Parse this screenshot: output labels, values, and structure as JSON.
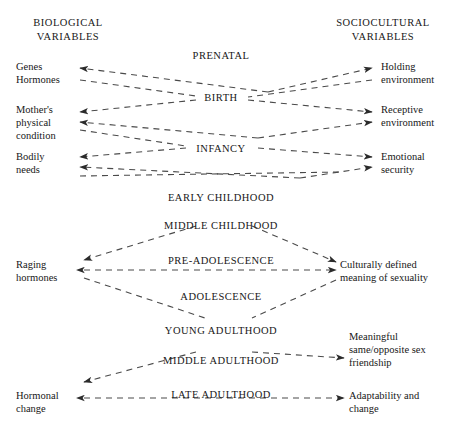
{
  "headings": {
    "biological": "BIOLOGICAL\nVARIABLES",
    "sociocultural": "SOCIOCULTURAL\nVARIABLES"
  },
  "stages": [
    {
      "label": "PRENATAL",
      "x": 221,
      "y": 50
    },
    {
      "label": "BIRTH",
      "x": 221,
      "y": 92
    },
    {
      "label": "INFANCY",
      "x": 221,
      "y": 143
    },
    {
      "label": "EARLY CHILDHOOD",
      "x": 221,
      "y": 192
    },
    {
      "label": "MIDDLE CHILDHOOD",
      "x": 221,
      "y": 220
    },
    {
      "label": "PRE-ADOLESCENCE",
      "x": 221,
      "y": 255
    },
    {
      "label": "ADOLESCENCE",
      "x": 221,
      "y": 291
    },
    {
      "label": "YOUNG ADULTHOOD",
      "x": 221,
      "y": 325
    },
    {
      "label": "MIDDLE ADULTHOOD",
      "x": 221,
      "y": 355
    },
    {
      "label": "LATE ADULTHOOD",
      "x": 221,
      "y": 389
    }
  ],
  "biological_variables": [
    {
      "label": "Genes\nHormones",
      "x": 16,
      "y": 60
    },
    {
      "label": "Mother's\nphysical\ncondition",
      "x": 16,
      "y": 103
    },
    {
      "label": "Bodily\nneeds",
      "x": 16,
      "y": 150
    },
    {
      "label": "Raging\nhormones",
      "x": 16,
      "y": 258
    },
    {
      "label": "Hormonal\nchange",
      "x": 16,
      "y": 389
    }
  ],
  "sociocultural_variables": [
    {
      "label": "Holding\nenvironment",
      "x": 381,
      "y": 60
    },
    {
      "label": "Receptive\nenvironment",
      "x": 381,
      "y": 103
    },
    {
      "label": "Emotional\nsecurity",
      "x": 381,
      "y": 150
    },
    {
      "label": "Culturally defined\nmeaning of sexuality",
      "x": 340,
      "y": 258
    },
    {
      "label": "Meaningful\nsame/opposite sex\nfriendship",
      "x": 349,
      "y": 330
    },
    {
      "label": "Adaptability and\nchange",
      "x": 349,
      "y": 389
    }
  ],
  "style": {
    "line_color": "#4a4a4a",
    "text_color": "#171717",
    "background": "#ffffff",
    "dash_pattern": "6,5"
  },
  "connections": [
    {
      "from": "BIRTH",
      "to": "Genes/Hormones",
      "x1": 268,
      "y1": 92,
      "x2": 80,
      "y2": 68,
      "arrow": "end"
    },
    {
      "from": "BIRTH",
      "to": "Holding environment",
      "x1": 268,
      "y1": 92,
      "x2": 372,
      "y2": 68,
      "arrow": "end"
    },
    {
      "from": "Hormones",
      "to": "BIRTH",
      "x1": 80,
      "y1": 80,
      "x2": 196,
      "y2": 96,
      "arrow": "none"
    },
    {
      "from": "Holding env.",
      "to": "BIRTH",
      "x1": 372,
      "y1": 80,
      "x2": 248,
      "y2": 97,
      "arrow": "none"
    },
    {
      "from": "BIRTH",
      "to": "Mother's condition",
      "x1": 196,
      "y1": 100,
      "x2": 80,
      "y2": 112,
      "arrow": "end"
    },
    {
      "from": "BIRTH",
      "to": "Receptive environment",
      "x1": 248,
      "y1": 100,
      "x2": 372,
      "y2": 112,
      "arrow": "end"
    },
    {
      "from": "INFANCY",
      "to": "Mother's condition",
      "x1": 258,
      "y1": 138,
      "x2": 80,
      "y2": 122,
      "arrow": "end"
    },
    {
      "from": "INFANCY",
      "to": "Receptive environment",
      "x1": 258,
      "y1": 138,
      "x2": 372,
      "y2": 122,
      "arrow": "end"
    },
    {
      "from": "Mother's cond.",
      "to": "INFANCY",
      "x1": 80,
      "y1": 130,
      "x2": 186,
      "y2": 146,
      "arrow": "none"
    },
    {
      "from": "INFANCY",
      "to": "Bodily needs",
      "x1": 186,
      "y1": 148,
      "x2": 80,
      "y2": 157,
      "arrow": "end"
    },
    {
      "from": "INFANCY",
      "to": "Emotional security",
      "x1": 258,
      "y1": 148,
      "x2": 372,
      "y2": 157,
      "arrow": "end"
    },
    {
      "from": "EARLY CHILDHOOD",
      "to": "Bodily needs",
      "x1": 300,
      "y1": 178,
      "x2": 80,
      "y2": 167,
      "arrow": "end"
    },
    {
      "from": "EARLY CHILDHOOD",
      "to": "Emotional security",
      "x1": 300,
      "y1": 178,
      "x2": 372,
      "y2": 167,
      "arrow": "end"
    },
    {
      "from": "Bodily needs",
      "to": "Emotional security",
      "x1": 80,
      "y1": 176,
      "x2": 340,
      "y2": 172,
      "arrow": "none"
    },
    {
      "from": "MIDDLE CHILDHOOD",
      "to": "Raging hormones",
      "x1": 196,
      "y1": 226,
      "x2": 84,
      "y2": 260,
      "arrow": "end"
    },
    {
      "from": "MIDDLE CHILDHOOD",
      "to": "Culturally defined meaning",
      "x1": 252,
      "y1": 226,
      "x2": 336,
      "y2": 262,
      "arrow": "end"
    },
    {
      "from": "Raging hormones",
      "to": "Culturally defined meaning",
      "x1": 84,
      "y1": 270,
      "x2": 336,
      "y2": 270,
      "arrow": "both"
    },
    {
      "from": "Raging hormones",
      "to": "YOUNG ADULTHOOD",
      "x1": 84,
      "y1": 278,
      "x2": 205,
      "y2": 318,
      "arrow": "none"
    },
    {
      "from": "Culturally def.",
      "to": "YOUNG ADULTHOOD",
      "x1": 336,
      "y1": 280,
      "x2": 252,
      "y2": 318,
      "arrow": "none"
    },
    {
      "from": "MIDDLE ADULTHOOD",
      "to": "Hormonal change",
      "x1": 196,
      "y1": 352,
      "x2": 84,
      "y2": 382,
      "arrow": "end"
    },
    {
      "from": "MIDDLE ADULTHOOD",
      "to": "Meaningful friendship",
      "x1": 252,
      "y1": 352,
      "x2": 344,
      "y2": 358,
      "arrow": "end"
    },
    {
      "from": "Hormonal change",
      "to": "Adaptability and change",
      "x1": 84,
      "y1": 398,
      "x2": 344,
      "y2": 398,
      "arrow": "both"
    }
  ]
}
